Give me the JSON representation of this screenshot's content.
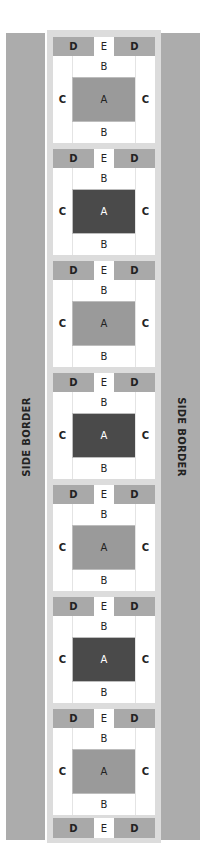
{
  "labels": {
    "side_border": "SIDE BORDER",
    "A": "A",
    "B": "B",
    "C": "C",
    "D": "D",
    "E": "E"
  },
  "colors": {
    "side_border": "#acacac",
    "frame": "#dcdcdc",
    "D": "#a9a9a9",
    "E": "#ffffff",
    "A_light": "#9a9a9a",
    "A_dark": "#4a4a4a"
  },
  "blocks": [
    {
      "index": 1,
      "A_shade": "light"
    },
    {
      "index": 2,
      "A_shade": "dark"
    },
    {
      "index": 3,
      "A_shade": "light"
    },
    {
      "index": 4,
      "A_shade": "dark"
    },
    {
      "index": 5,
      "A_shade": "light"
    },
    {
      "index": 6,
      "A_shade": "dark"
    },
    {
      "index": 7,
      "A_shade": "light"
    }
  ]
}
